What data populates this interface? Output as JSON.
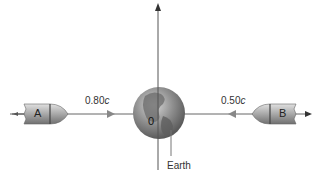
{
  "diagram": {
    "ship_a": {
      "label": "A",
      "speed": "0.80",
      "speed_unit": "c",
      "direction": "right"
    },
    "ship_b": {
      "label": "B",
      "speed": "0.50",
      "speed_unit": "c",
      "direction": "left"
    },
    "origin_label": "0",
    "earth_label": "Earth",
    "colors": {
      "line": "#555555",
      "ship": "#9a9a9a",
      "globe": "#8a8a8a"
    }
  }
}
